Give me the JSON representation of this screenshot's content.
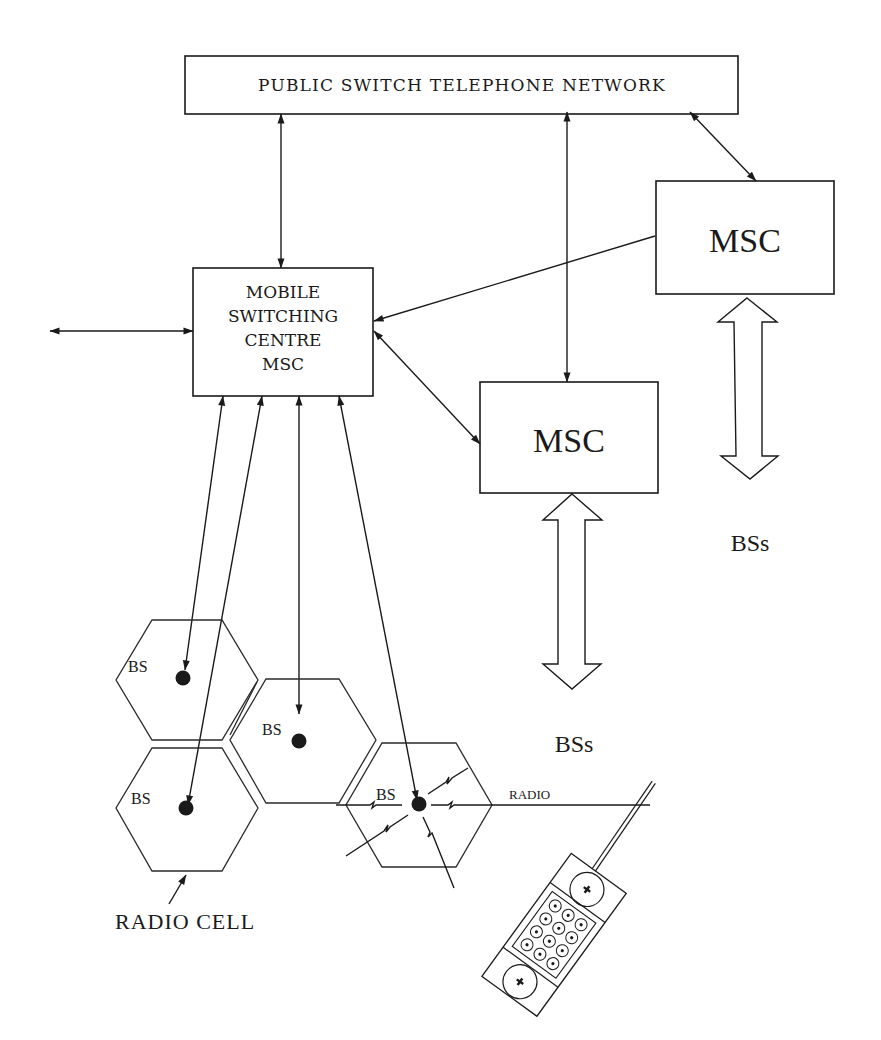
{
  "diagram": {
    "pstn": {
      "label": "PUBLIC SWITCH TELEPHONE NETWORK"
    },
    "main_msc": {
      "lines": [
        "MOBILE",
        "SWITCHING",
        "CENTRE",
        "MSC"
      ]
    },
    "msc_right": {
      "label": "MSC"
    },
    "msc_middle": {
      "label": "MSC"
    },
    "bss_middle": {
      "label": "BSs"
    },
    "bss_right": {
      "label": "BSs"
    },
    "base_stations": [
      {
        "label": "BS"
      },
      {
        "label": "BS"
      },
      {
        "label": "BS"
      },
      {
        "label": "BS"
      }
    ],
    "radio_label": "RADIO",
    "radio_cell_label": "RADIO CELL",
    "icons": {
      "handset": "mobile-phone-icon",
      "bidirectional": "double-arrow-icon",
      "base_station": "filled-dot-icon",
      "radio_link": "lightning-zigzag-icon"
    },
    "colors": {
      "ink": "#1a1a1a",
      "background": "#ffffff"
    }
  }
}
